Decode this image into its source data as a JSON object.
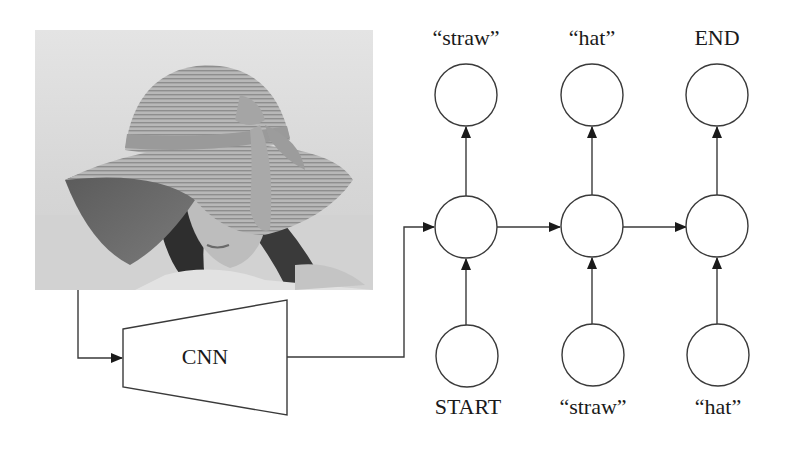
{
  "diagram": {
    "image": {
      "subject": "woman wearing a straw hat with a scarf band",
      "style": "grayscale photo"
    },
    "encoder": {
      "label": "CNN"
    },
    "outputs": [
      {
        "label": "“straw”"
      },
      {
        "label": "“hat”"
      },
      {
        "label": "END"
      }
    ],
    "inputs": [
      {
        "label": "START"
      },
      {
        "label": "“straw”"
      },
      {
        "label": "“hat”"
      }
    ],
    "colors": {
      "stroke": "#3a3a3a",
      "text": "#1a1a1a",
      "background": "#ffffff"
    }
  }
}
